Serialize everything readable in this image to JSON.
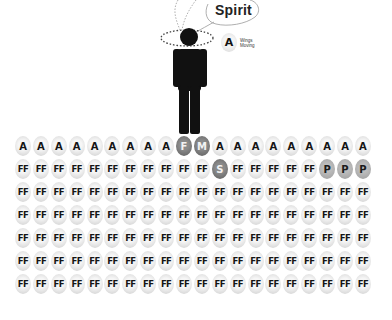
{
  "bubble": {
    "label": "Spirit"
  },
  "legend": {
    "symbol": "A",
    "text": "Wings Moving"
  },
  "colors": {
    "light_circle": "#e0e0e0",
    "dark_circle": "#6f6f6f",
    "mid_circle": "#a8a8a8",
    "figure": "#111111"
  },
  "grid": {
    "rows": [
      [
        "A",
        "A",
        "A",
        "A",
        "A",
        "A",
        "A",
        "A",
        "A",
        "F",
        "M",
        "A",
        "A",
        "A",
        "A",
        "A",
        "A",
        "A",
        "A",
        "A"
      ],
      [
        "FF",
        "FF",
        "FF",
        "FF",
        "FF",
        "FF",
        "FF",
        "FF",
        "FF",
        "FF",
        "FF",
        "S",
        "FF",
        "FF",
        "FF",
        "FF",
        "FF",
        "P",
        "P",
        "P"
      ],
      [
        "FF",
        "FF",
        "FF",
        "FF",
        "FF",
        "FF",
        "FF",
        "FF",
        "FF",
        "FF",
        "FF",
        "FF",
        "FF",
        "FF",
        "FF",
        "FF",
        "FF",
        "FF",
        "FF",
        "FF"
      ],
      [
        "FF",
        "FF",
        "FF",
        "FF",
        "FF",
        "FF",
        "FF",
        "FF",
        "FF",
        "FF",
        "FF",
        "FF",
        "FF",
        "FF",
        "FF",
        "FF",
        "FF",
        "FF",
        "FF",
        "FF"
      ],
      [
        "FF",
        "FF",
        "FF",
        "FF",
        "FF",
        "FF",
        "FF",
        "FF",
        "FF",
        "FF",
        "FF",
        "FF",
        "FF",
        "FF",
        "FF",
        "FF",
        "FF",
        "FF",
        "FF",
        "FF"
      ],
      [
        "FF",
        "FF",
        "FF",
        "FF",
        "FF",
        "FF",
        "FF",
        "FF",
        "FF",
        "FF",
        "FF",
        "FF",
        "FF",
        "FF",
        "FF",
        "FF",
        "FF",
        "FF",
        "FF",
        "FF"
      ],
      [
        "FF",
        "FF",
        "FF",
        "FF",
        "FF",
        "FF",
        "FF",
        "FF",
        "FF",
        "FF",
        "FF",
        "FF",
        "FF",
        "FF",
        "FF",
        "FF",
        "FF",
        "FF",
        "FF",
        "FF"
      ]
    ],
    "dark_labels": [
      "F",
      "M",
      "S"
    ],
    "mid_labels": [
      "P"
    ]
  }
}
